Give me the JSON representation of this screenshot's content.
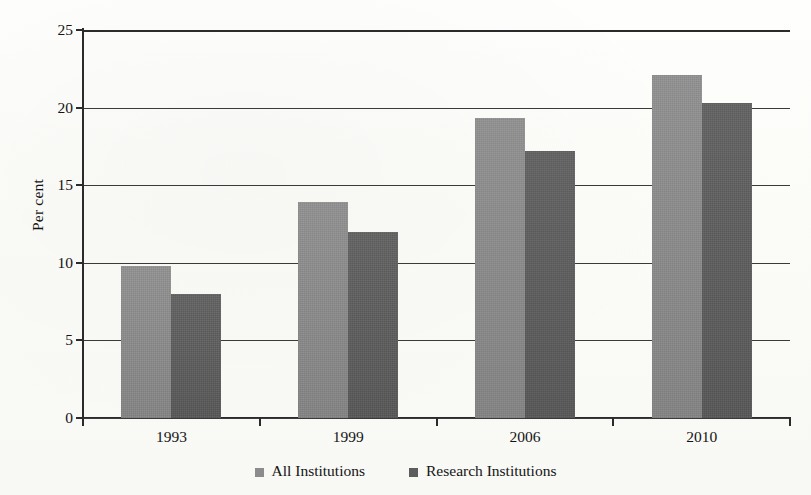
{
  "chart_data": {
    "type": "bar",
    "title": "",
    "xlabel": "",
    "ylabel": "Per cent",
    "categories": [
      "1993",
      "1999",
      "2006",
      "2010"
    ],
    "series": [
      {
        "name": "All Institutions",
        "values": [
          9.8,
          13.9,
          19.3,
          22.1
        ],
        "color": "#8c8c8c"
      },
      {
        "name": "Research Institutions",
        "values": [
          8.0,
          12.0,
          17.2,
          20.3
        ],
        "color": "#5d5d5d"
      }
    ],
    "ylim": [
      0,
      25
    ],
    "ytick_labels": [
      "0",
      "5",
      "10",
      "15",
      "20",
      "25"
    ],
    "ytick_values": [
      0,
      5,
      10,
      15,
      20,
      25
    ],
    "grid": true,
    "legend_position": "bottom"
  },
  "legend": {
    "items": [
      {
        "label": "All Institutions",
        "marker": "square-marker-light"
      },
      {
        "label": "Research Institutions",
        "marker": "square-marker-dark"
      }
    ]
  },
  "colors": {
    "series_light": "#8c8c8c",
    "series_dark": "#5d5d5d",
    "axis": "#2b2b2b",
    "background": "#fdfdfb"
  }
}
